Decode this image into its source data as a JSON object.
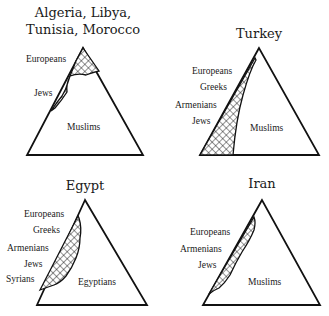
{
  "panels": [
    {
      "title_lines": [
        "Algeria, Libya,",
        "Tunisia, Morocco"
      ],
      "minority_labels": [
        "Europeans",
        "Jews"
      ],
      "majority_label": "Muslims"
    },
    {
      "title_lines": [
        "Turkey"
      ],
      "minority_labels": [
        "Europeans",
        "Greeks",
        "Armenians",
        "Jews"
      ],
      "majority_label": "Muslims"
    },
    {
      "title_lines": [
        "Egypt"
      ],
      "minority_labels": [
        "Europeans",
        "Greeks",
        "Armenians",
        "Jews",
        "Syrians"
      ],
      "majority_label": "Egyptians"
    },
    {
      "title_lines": [
        "Iran"
      ],
      "minority_labels": [
        "Europeans",
        "Armenians",
        "Jews"
      ],
      "majority_label": "Muslims"
    }
  ],
  "colors": {
    "ink": "#111111",
    "background": "#ffffff"
  }
}
